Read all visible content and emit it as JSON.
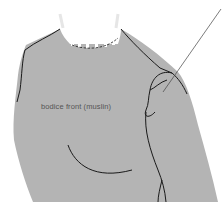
{
  "diagram": {
    "label": "bodice front (muslin)",
    "colors": {
      "fabric": "#b4b4b4",
      "outline": "#1a1a1a",
      "background": "#ffffff",
      "label_text": "#555555"
    }
  }
}
